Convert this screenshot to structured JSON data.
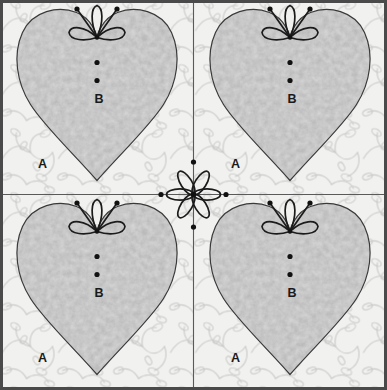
{
  "diagram": {
    "type": "quilt-block-pattern",
    "width": 387,
    "height": 390,
    "grid": {
      "rows": 2,
      "columns": 4,
      "blocks": 4
    },
    "colors": {
      "background_fabric": "#f1f1ef",
      "heart_fabric": "#b0b0b0",
      "heart_fabric_mottle": "#9a9a9a",
      "outline": "#3a3a3a",
      "stipple_line": "#c8c8c8",
      "border": "#4a4a4a",
      "label_text": "#1a1a1a",
      "dot": "#111111",
      "page": "#ffffff"
    },
    "labels": {
      "background_piece": "A",
      "heart_piece": "B"
    },
    "blocks": [
      {
        "position": "top-left",
        "heart_label": "B",
        "background_label": "A",
        "motif": "flower-bud-spray",
        "inner_dots": 2
      },
      {
        "position": "top-right",
        "heart_label": "B",
        "background_label": "A",
        "motif": "flower-bud-spray",
        "inner_dots": 2
      },
      {
        "position": "bottom-left",
        "heart_label": "B",
        "background_label": "A",
        "motif": "flower-bud-spray",
        "inner_dots": 2
      },
      {
        "position": "bottom-right",
        "heart_label": "B",
        "background_label": "A",
        "motif": "flower-bud-spray",
        "inner_dots": 2
      }
    ],
    "center_motif": {
      "name": "six-petal-flower",
      "petals": 6,
      "axis_lines": [
        "horizontal",
        "vertical"
      ],
      "axis_dots": 4
    }
  }
}
